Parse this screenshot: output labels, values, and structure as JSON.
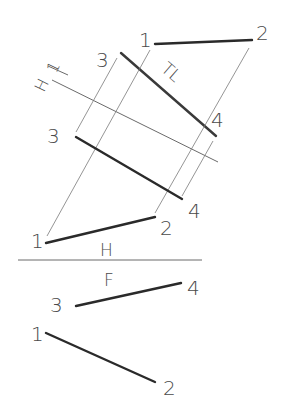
{
  "labels": {
    "top_1": "1",
    "top_2": "2",
    "aux_3_top": "3",
    "aux_tl": "TL",
    "aux_4_top": "4",
    "aux_h1_h": "H",
    "aux_h1_1": "1",
    "aux_3_mid": "3",
    "aux_4_mid": "4",
    "h_1": "1",
    "h_2": "2",
    "fold_h": "H",
    "fold_f": "F",
    "f_3": "3",
    "f_4": "4",
    "f_1": "1",
    "f_2": "2"
  },
  "colors": {
    "line_dark": "#2a2a2a",
    "line_thin": "#7a7a7a",
    "label": "#4a4a4a",
    "background": "#ffffff"
  }
}
